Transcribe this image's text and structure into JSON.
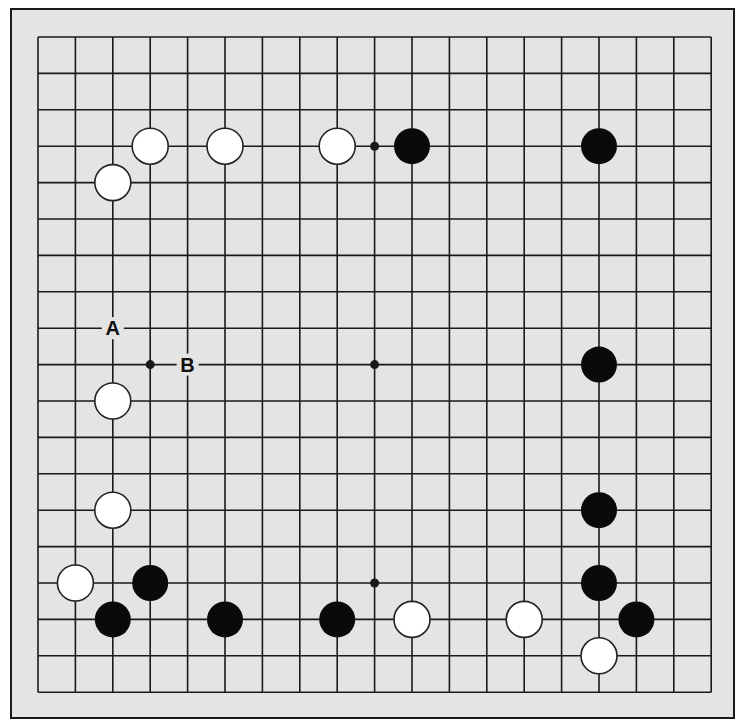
{
  "board": {
    "size": 19,
    "origin": {
      "x": 38,
      "y": 37
    },
    "spacing": {
      "x": 37.4,
      "y": 36.4
    },
    "colors": {
      "background": "#e4e4e4",
      "line": "#1a1a1a",
      "black": "#0a0a0a",
      "white": "#ffffff"
    },
    "star_points": [
      [
        9,
        3
      ],
      [
        3,
        9
      ],
      [
        9,
        9
      ],
      [
        9,
        15
      ]
    ],
    "stones": [
      {
        "color": "white",
        "col": 3,
        "row": 3
      },
      {
        "color": "white",
        "col": 5,
        "row": 3
      },
      {
        "color": "white",
        "col": 8,
        "row": 3
      },
      {
        "color": "black",
        "col": 10,
        "row": 3
      },
      {
        "color": "black",
        "col": 15,
        "row": 3
      },
      {
        "color": "white",
        "col": 2,
        "row": 4
      },
      {
        "color": "black",
        "col": 15,
        "row": 9
      },
      {
        "color": "white",
        "col": 2,
        "row": 10
      },
      {
        "color": "white",
        "col": 2,
        "row": 13
      },
      {
        "color": "black",
        "col": 15,
        "row": 13
      },
      {
        "color": "white",
        "col": 1,
        "row": 15
      },
      {
        "color": "black",
        "col": 3,
        "row": 15
      },
      {
        "color": "black",
        "col": 15,
        "row": 15
      },
      {
        "color": "black",
        "col": 2,
        "row": 16
      },
      {
        "color": "black",
        "col": 5,
        "row": 16
      },
      {
        "color": "black",
        "col": 8,
        "row": 16
      },
      {
        "color": "white",
        "col": 10,
        "row": 16
      },
      {
        "color": "white",
        "col": 13,
        "row": 16
      },
      {
        "color": "black",
        "col": 16,
        "row": 16
      },
      {
        "color": "white",
        "col": 15,
        "row": 17
      }
    ],
    "labels": [
      {
        "text": "A",
        "col": 2,
        "row": 8
      },
      {
        "text": "B",
        "col": 4,
        "row": 9
      }
    ]
  }
}
